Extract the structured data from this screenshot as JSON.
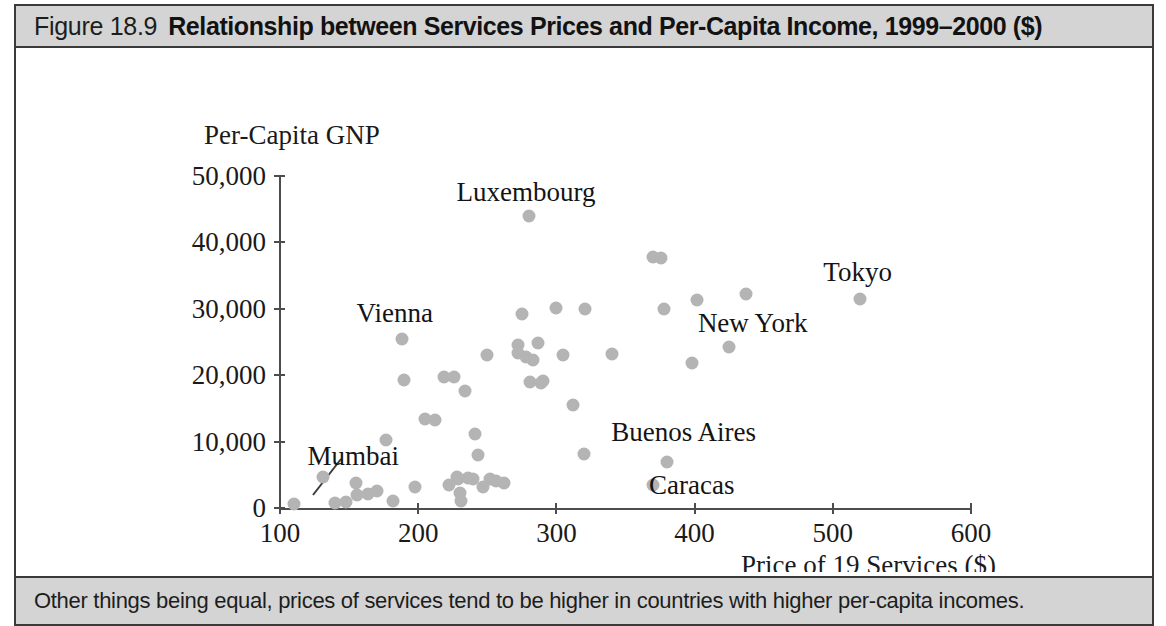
{
  "figure": {
    "number": "Figure 18.9",
    "title": "Relationship between Services Prices and Per-Capita Income, 1999–2000 ($)",
    "caption": "Other things being equal, prices of services tend to be higher in countries with higher per-capita incomes.",
    "title_bar_color": "#d4d4d4",
    "border_color": "#3a3a3a",
    "dot_color": "#b4b4b4"
  },
  "chart_data": {
    "type": "scatter",
    "title": "Relationship between Services Prices and Per-Capita Income, 1999–2000 ($)",
    "xlabel": "Price of 19 Services ($)",
    "ylabel": "Per-Capita GNP",
    "xlim": [
      100,
      600
    ],
    "ylim": [
      0,
      50000
    ],
    "xticks": [
      100,
      200,
      300,
      400,
      500,
      600
    ],
    "xtick_labels": [
      "100",
      "200",
      "300",
      "400",
      "500",
      "600"
    ],
    "yticks": [
      0,
      10000,
      20000,
      30000,
      40000,
      50000
    ],
    "ytick_labels": [
      "0",
      "10,000",
      "20,000",
      "30,000",
      "40,000",
      "50,000"
    ],
    "grid": false,
    "legend": "none",
    "marker": "circle",
    "marker_color": "#b4b4b4",
    "annotations": [
      {
        "label": "Luxembourg",
        "x": 280,
        "y": 44000,
        "label_x": 278,
        "label_y": 47600,
        "leader": false
      },
      {
        "label": "Tokyo",
        "x": 520,
        "y": 31500,
        "label_x": 518,
        "label_y": 35600,
        "leader": false
      },
      {
        "label": "New York",
        "x": 425,
        "y": 24200,
        "label_x": 442,
        "label_y": 27800,
        "leader": false
      },
      {
        "label": "Vienna",
        "x": 188,
        "y": 25500,
        "label_x": 183,
        "label_y": 29400,
        "leader": false
      },
      {
        "label": "Buenos Aires",
        "x": 380,
        "y": 7000,
        "label_x": 392,
        "label_y": 11400,
        "leader": false
      },
      {
        "label": "Caracas",
        "x": 370,
        "y": 3400,
        "label_x": 398,
        "label_y": 3500,
        "leader": false
      },
      {
        "label": "Mumbai",
        "x": 110,
        "y": 600,
        "label_x": 153,
        "label_y": 7900,
        "leader": true
      }
    ],
    "points": [
      {
        "x": 110,
        "y": 600
      },
      {
        "x": 131,
        "y": 4600
      },
      {
        "x": 140,
        "y": 800
      },
      {
        "x": 148,
        "y": 900
      },
      {
        "x": 155,
        "y": 3700
      },
      {
        "x": 156,
        "y": 2000
      },
      {
        "x": 164,
        "y": 2100
      },
      {
        "x": 170,
        "y": 2600
      },
      {
        "x": 177,
        "y": 10200
      },
      {
        "x": 182,
        "y": 1000
      },
      {
        "x": 188,
        "y": 25500
      },
      {
        "x": 190,
        "y": 19300
      },
      {
        "x": 198,
        "y": 3200
      },
      {
        "x": 205,
        "y": 13400
      },
      {
        "x": 212,
        "y": 13300
      },
      {
        "x": 219,
        "y": 19700
      },
      {
        "x": 222,
        "y": 3400
      },
      {
        "x": 226,
        "y": 19800
      },
      {
        "x": 228,
        "y": 4600
      },
      {
        "x": 229,
        "y": 4400
      },
      {
        "x": 230,
        "y": 2300
      },
      {
        "x": 231,
        "y": 1100
      },
      {
        "x": 234,
        "y": 17600
      },
      {
        "x": 236,
        "y": 4500
      },
      {
        "x": 240,
        "y": 4400
      },
      {
        "x": 241,
        "y": 11200
      },
      {
        "x": 243,
        "y": 8000
      },
      {
        "x": 247,
        "y": 3100
      },
      {
        "x": 250,
        "y": 23100
      },
      {
        "x": 252,
        "y": 4300
      },
      {
        "x": 256,
        "y": 4000
      },
      {
        "x": 262,
        "y": 3800
      },
      {
        "x": 272,
        "y": 24500
      },
      {
        "x": 272,
        "y": 23400
      },
      {
        "x": 275,
        "y": 29200
      },
      {
        "x": 278,
        "y": 22800
      },
      {
        "x": 280,
        "y": 44000
      },
      {
        "x": 281,
        "y": 19000
      },
      {
        "x": 283,
        "y": 22300
      },
      {
        "x": 287,
        "y": 24900
      },
      {
        "x": 289,
        "y": 18800
      },
      {
        "x": 290,
        "y": 19100
      },
      {
        "x": 300,
        "y": 30100
      },
      {
        "x": 305,
        "y": 23100
      },
      {
        "x": 312,
        "y": 15500
      },
      {
        "x": 320,
        "y": 8200
      },
      {
        "x": 321,
        "y": 30000
      },
      {
        "x": 340,
        "y": 23200
      },
      {
        "x": 370,
        "y": 37800
      },
      {
        "x": 376,
        "y": 37700
      },
      {
        "x": 378,
        "y": 30000
      },
      {
        "x": 380,
        "y": 7000
      },
      {
        "x": 370,
        "y": 3400
      },
      {
        "x": 398,
        "y": 21900
      },
      {
        "x": 402,
        "y": 31300
      },
      {
        "x": 425,
        "y": 24200
      },
      {
        "x": 437,
        "y": 32200
      },
      {
        "x": 520,
        "y": 31500
      }
    ]
  }
}
